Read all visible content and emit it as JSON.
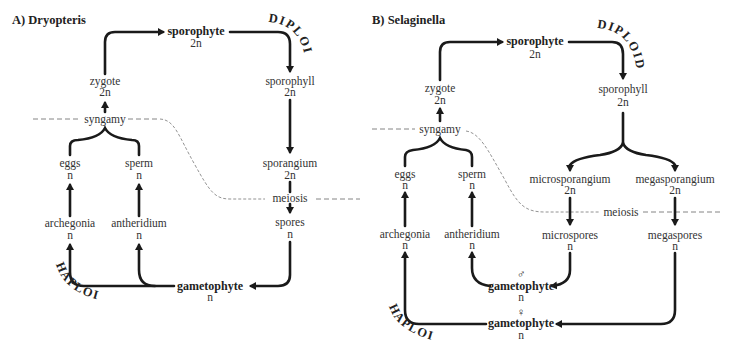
{
  "panel_a": {
    "title": "A) Dryopteris",
    "phases": {
      "diploid": "DIPLOID",
      "haploid": "HAPLOID"
    },
    "nodes": {
      "sporophyte": {
        "label": "sporophyte",
        "ploidy": "2n"
      },
      "zygote": {
        "label": "zygote",
        "ploidy": "2n"
      },
      "syngamy": {
        "label": "syngamy"
      },
      "eggs": {
        "label": "eggs",
        "ploidy": "n"
      },
      "sperm": {
        "label": "sperm",
        "ploidy": "n"
      },
      "archegonia": {
        "label": "archegonia",
        "ploidy": "n"
      },
      "antheridium": {
        "label": "antheridium",
        "ploidy": "n"
      },
      "sporophyll": {
        "label": "sporophyll",
        "ploidy": "2n"
      },
      "sporangium": {
        "label": "sporangium",
        "ploidy": "2n"
      },
      "meiosis": {
        "label": "meiosis"
      },
      "spores": {
        "label": "spores",
        "ploidy": "n"
      },
      "gametophyte": {
        "label": "gametophyte",
        "ploidy": "n"
      }
    }
  },
  "panel_b": {
    "title": "B) Selaginella",
    "phases": {
      "diploid": "DIPLOID",
      "haploid": "HAPLOID"
    },
    "nodes": {
      "sporophyte": {
        "label": "sporophyte",
        "ploidy": "2n"
      },
      "zygote": {
        "label": "zygote",
        "ploidy": "2n"
      },
      "syngamy": {
        "label": "syngamy"
      },
      "eggs": {
        "label": "eggs",
        "ploidy": "n"
      },
      "sperm": {
        "label": "sperm",
        "ploidy": "n"
      },
      "archegonia": {
        "label": "archegonia",
        "ploidy": "n"
      },
      "antheridium": {
        "label": "antheridium",
        "ploidy": "n"
      },
      "sporophyll": {
        "label": "sporophyll",
        "ploidy": "2n"
      },
      "microsporangium": {
        "label": "microsporangium",
        "ploidy": "2n"
      },
      "megasporangium": {
        "label": "megasporangium",
        "ploidy": "2n"
      },
      "meiosis": {
        "label": "meiosis"
      },
      "microspores": {
        "label": "microspores",
        "ploidy": "n"
      },
      "megaspores": {
        "label": "megaspores",
        "ploidy": "n"
      },
      "male_gametophyte": {
        "symbol": "♂",
        "label": "gametophyte",
        "ploidy": "n"
      },
      "female_gametophyte": {
        "symbol": "♀",
        "label": "gametophyte",
        "ploidy": "n"
      }
    }
  }
}
